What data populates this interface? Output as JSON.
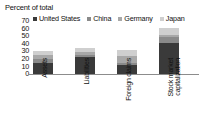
{
  "chart_data": {
    "type": "bar",
    "subtype": "stacked-column",
    "title": "Percent of total",
    "xlabel": "",
    "ylabel": "Percent of total",
    "ylim": [
      0,
      70
    ],
    "yticks": [
      0,
      10,
      20,
      30,
      40,
      50,
      60,
      70
    ],
    "ytick_labels": [
      "0",
      "10",
      "20",
      "30",
      "40",
      "50",
      "60",
      "70"
    ],
    "grid": false,
    "legend_position": "top",
    "categories": [
      "Assets",
      "Liabilities",
      "Foreign claims",
      "Stock market capitalization"
    ],
    "series": [
      {
        "name": "United States",
        "color": "#3a3a3a",
        "values": [
          15,
          22,
          12,
          41
        ]
      },
      {
        "name": "China",
        "color": "#8a8a8a",
        "values": [
          5,
          3,
          3,
          8
        ]
      },
      {
        "name": "Germany",
        "color": "#a8a8a8",
        "values": [
          5,
          4,
          9,
          3
        ]
      },
      {
        "name": "Japan",
        "color": "#cfcfcf",
        "values": [
          6,
          5,
          8,
          9
        ]
      }
    ],
    "totals": [
      31,
      34,
      32,
      61
    ]
  },
  "axis": {
    "title": "Percent of total",
    "ticks": [
      "70",
      "60",
      "50",
      "40",
      "30",
      "20",
      "10",
      "0"
    ]
  },
  "legend": {
    "items": [
      {
        "label": "United States",
        "color": "#3a3a3a"
      },
      {
        "label": "China",
        "color": "#8a8a8a"
      },
      {
        "label": "Germany",
        "color": "#a8a8a8"
      },
      {
        "label": "Japan",
        "color": "#cfcfcf"
      }
    ]
  },
  "categories": [
    {
      "label": "Assets"
    },
    {
      "label": "Liabilities"
    },
    {
      "label": "Foreign claims"
    },
    {
      "label": "Stock market capitalization"
    }
  ]
}
